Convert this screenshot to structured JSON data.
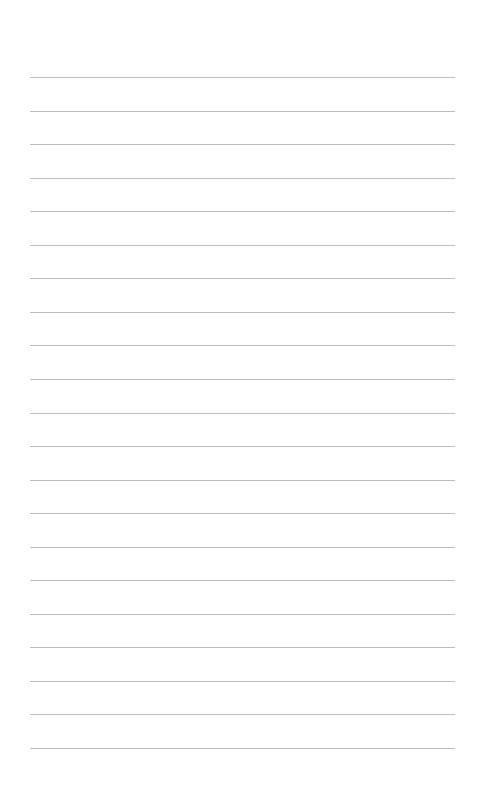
{
  "page": {
    "type": "lined-paper",
    "background_color": "#ffffff",
    "line_color": "#bdbdbd",
    "line_count": 21,
    "first_line_y": 77,
    "line_spacing": 33.55,
    "line_left": 30,
    "line_width": 425
  }
}
